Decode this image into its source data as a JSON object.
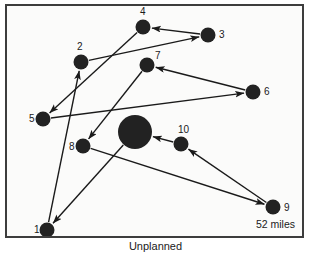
{
  "figure": {
    "caption": "Unplanned",
    "distance_label": "52 miles",
    "frame": {
      "x": 5,
      "y": 4,
      "width": 299,
      "height": 234
    }
  },
  "chart_data": {
    "type": "scatter",
    "title": "Unplanned",
    "xlabel": "",
    "ylabel": "",
    "annotations": [
      "52 miles"
    ],
    "grid": false,
    "legend": null,
    "coordinate_space": {
      "width": 299,
      "height": 234,
      "units": "px"
    },
    "nodes": [
      {
        "id": "depot",
        "label": "",
        "x": 128,
        "y": 126,
        "r": 17,
        "color": "#222222",
        "kind": "depot"
      },
      {
        "id": "1",
        "label": "1",
        "x": 40,
        "y": 224,
        "r": 7.5,
        "color": "#222222",
        "kind": "stop",
        "label_dx": -13,
        "label_dy": -5
      },
      {
        "id": "2",
        "label": "2",
        "x": 74,
        "y": 56,
        "r": 7.5,
        "color": "#222222",
        "kind": "stop",
        "label_dx": -4,
        "label_dy": -20
      },
      {
        "id": "3",
        "label": "3",
        "x": 201,
        "y": 29,
        "r": 7.5,
        "color": "#222222",
        "kind": "stop",
        "label_dx": 11,
        "label_dy": -5
      },
      {
        "id": "4",
        "label": "4",
        "x": 136,
        "y": 21,
        "r": 7.5,
        "color": "#222222",
        "kind": "stop",
        "label_dx": -3,
        "label_dy": -20
      },
      {
        "id": "5",
        "label": "5",
        "x": 36,
        "y": 113,
        "r": 7.5,
        "color": "#222222",
        "kind": "stop",
        "label_dx": -14,
        "label_dy": -5
      },
      {
        "id": "6",
        "label": "6",
        "x": 246,
        "y": 86,
        "r": 7.5,
        "color": "#222222",
        "kind": "stop",
        "label_dx": 11,
        "label_dy": -5
      },
      {
        "id": "7",
        "label": "7",
        "x": 140,
        "y": 59,
        "r": 7.5,
        "color": "#222222",
        "kind": "stop",
        "label_dx": 8,
        "label_dy": -14
      },
      {
        "id": "8",
        "label": "8",
        "x": 76,
        "y": 140,
        "r": 7.5,
        "color": "#222222",
        "kind": "stop",
        "label_dx": -14,
        "label_dy": -4
      },
      {
        "id": "9",
        "label": "9",
        "x": 266,
        "y": 201,
        "r": 7.5,
        "color": "#222222",
        "kind": "stop",
        "label_dx": 11,
        "label_dy": -4
      },
      {
        "id": "10",
        "label": "10",
        "x": 174,
        "y": 138,
        "r": 7.5,
        "color": "#222222",
        "kind": "stop",
        "label_dx": -3,
        "label_dy": -19
      }
    ],
    "edges": [
      {
        "from": "depot",
        "to": "1"
      },
      {
        "from": "1",
        "to": "2"
      },
      {
        "from": "2",
        "to": "3"
      },
      {
        "from": "3",
        "to": "4"
      },
      {
        "from": "4",
        "to": "5"
      },
      {
        "from": "5",
        "to": "6"
      },
      {
        "from": "6",
        "to": "7"
      },
      {
        "from": "7",
        "to": "8"
      },
      {
        "from": "8",
        "to": "9"
      },
      {
        "from": "9",
        "to": "10"
      },
      {
        "from": "10",
        "to": "depot"
      }
    ],
    "style": {
      "edge_color": "#1a1a1a",
      "edge_width": 1.4,
      "node_color": "#222222",
      "frame_color": "#3d3d3d",
      "background": "#fbfbfa"
    }
  }
}
